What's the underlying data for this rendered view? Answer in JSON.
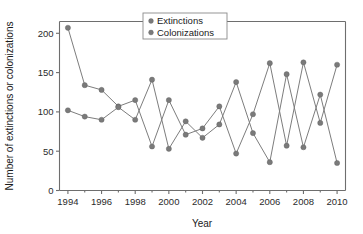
{
  "chart_data": {
    "type": "line",
    "title": "",
    "xlabel": "Year",
    "ylabel": "Number of extinctions or colonizations",
    "x": [
      1994,
      1995,
      1996,
      1997,
      1998,
      1999,
      2000,
      2001,
      2002,
      2003,
      2004,
      2005,
      2006,
      2007,
      2008,
      2009,
      2010
    ],
    "xlim": [
      1993.5,
      2010.5
    ],
    "ylim": [
      0,
      215
    ],
    "xticks": [
      1994,
      1996,
      1998,
      2000,
      2002,
      2004,
      2006,
      2008,
      2010
    ],
    "xtick_labels": [
      "1994",
      "1996",
      "1998",
      "2000",
      "2002",
      "2004",
      "2006",
      "2008",
      "2010"
    ],
    "xminor_ticks": [
      1995,
      1997,
      1999,
      2001,
      2003,
      2005,
      2007,
      2009
    ],
    "yticks": [
      0,
      50,
      100,
      150,
      200
    ],
    "ytick_labels": [
      "0",
      "50",
      "100",
      "150",
      "200"
    ],
    "grid": false,
    "legend_position": "top-center",
    "marker": "circle",
    "series": [
      {
        "name": "Extinctions",
        "color": "#7a7a7a",
        "values": [
          207,
          134,
          128,
          107,
          115,
          56,
          115,
          71,
          79,
          107,
          47,
          97,
          162,
          57,
          163,
          86,
          160
        ]
      },
      {
        "name": "Colonizations",
        "color": "#7a7a7a",
        "values": [
          102,
          94,
          90,
          106,
          90,
          141,
          53,
          88,
          67,
          84,
          138,
          73,
          36,
          148,
          55,
          122,
          35
        ]
      }
    ]
  },
  "legend": {
    "items": [
      {
        "label": "Extinctions"
      },
      {
        "label": "Colonizations"
      }
    ]
  },
  "axes": {
    "x_title": "Year",
    "y_title": "Number of extinctions or colonizations"
  }
}
